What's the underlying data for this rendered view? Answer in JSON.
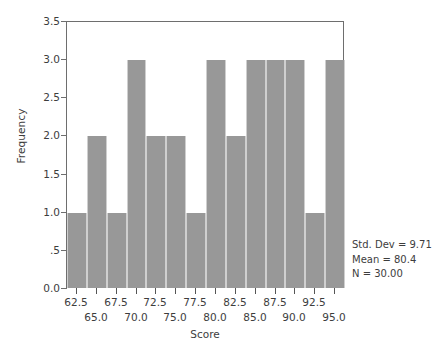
{
  "chart_data": {
    "type": "bar",
    "title": "",
    "xlabel": "Score",
    "ylabel": "Frequency",
    "categories": [
      "62.5",
      "65.0",
      "67.5",
      "70.0",
      "72.5",
      "75.0",
      "77.5",
      "80.0",
      "82.5",
      "85.0",
      "87.5",
      "90.0",
      "92.5",
      "95.0"
    ],
    "values": [
      1,
      2,
      1,
      3,
      2,
      2,
      1,
      3,
      2,
      3,
      3,
      3,
      1,
      3
    ],
    "bin_width": 2.5,
    "xlim": [
      61.25,
      96.25
    ],
    "ylim": [
      0,
      3.5
    ],
    "ytick_labels": [
      "0.0",
      ".5",
      "1.0",
      "1.5",
      "2.0",
      "2.5",
      "3.0",
      "3.5"
    ],
    "ytick_values": [
      0,
      0.5,
      1.0,
      1.5,
      2.0,
      2.5,
      3.0,
      3.5
    ],
    "xtick_labels_upper": [
      "62.5",
      "67.5",
      "72.5",
      "77.5",
      "82.5",
      "87.5",
      "92.5"
    ],
    "xtick_labels_lower": [
      "65.0",
      "70.0",
      "75.0",
      "80.0",
      "85.0",
      "90.0",
      "95.0"
    ],
    "grid": false,
    "legend": "none",
    "bar_color": "#989898",
    "annotations": [
      "Std. Dev = 9.71",
      "Mean = 80.4",
      "N = 30.00"
    ]
  },
  "stats": {
    "std_dev": "Std. Dev = 9.71",
    "mean": "Mean = 80.4",
    "n": "N = 30.00"
  },
  "axes": {
    "x_title": "Score",
    "y_title": "Frequency"
  }
}
